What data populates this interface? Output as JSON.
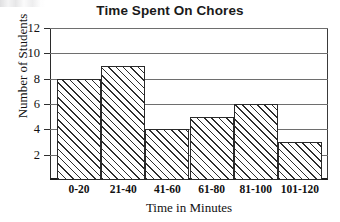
{
  "chart_data": {
    "type": "bar",
    "title": "Time Spent On Chores",
    "xlabel": "Time in Minutes",
    "ylabel": "Number of Students",
    "categories": [
      "0-20",
      "21-40",
      "41-60",
      "61-80",
      "81-100",
      "101-120"
    ],
    "values": [
      8,
      9,
      4,
      5,
      6,
      3
    ],
    "ylim": [
      0,
      12
    ],
    "yticks": [
      2,
      4,
      6,
      8,
      10,
      12
    ],
    "ytick_labels": [
      "2",
      "4",
      "6",
      "8",
      "10",
      "12"
    ],
    "grid": true,
    "legend": "none",
    "bar_style": "diagonal-hatch",
    "colors": {
      "background": "#ffffff",
      "bar_outline": "#2a2a2a",
      "hatch": "#2e2e2e",
      "gridline": "#6e6e6e",
      "axis": "#1c1c1c",
      "text": "#111111"
    }
  }
}
